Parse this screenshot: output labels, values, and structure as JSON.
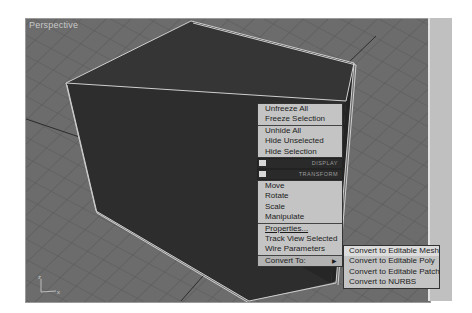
{
  "viewport": {
    "label": "Perspective",
    "axis_labels": {
      "z": "z",
      "x": "x"
    }
  },
  "colors": {
    "grid_floor": "#6c6c6c",
    "grid_lines": "#565656",
    "cube_face": "#2e2e2e",
    "selection_edge": "#d0d0d0",
    "menu_bg": "#c4c4c4",
    "menu_header_bg": "#2a2a2a"
  },
  "quad_menu": {
    "display_section": {
      "items": [
        {
          "label": "Unfreeze All"
        },
        {
          "label": "Freeze Selection"
        }
      ],
      "items2": [
        {
          "label": "Unhide All"
        },
        {
          "label": "Hide Unselected"
        },
        {
          "label": "Hide Selection"
        }
      ],
      "header": "DISPLAY"
    },
    "transform_section": {
      "header": "TRANSFORM",
      "items": [
        {
          "label": "Move"
        },
        {
          "label": "Rotate"
        },
        {
          "label": "Scale"
        },
        {
          "label": "Manipulate"
        }
      ],
      "items2": [
        {
          "label": "Properties..."
        },
        {
          "label": "Track View Selected"
        },
        {
          "label": "Wire Parameters"
        }
      ],
      "convert": {
        "label": "Convert To:",
        "arrow": "▶"
      }
    }
  },
  "convert_submenu": {
    "items": [
      {
        "label": "Convert to Editable Mesh"
      },
      {
        "label": "Convert to Editable Poly"
      },
      {
        "label": "Convert to Editable Patch"
      },
      {
        "label": "Convert to NURBS"
      }
    ]
  }
}
